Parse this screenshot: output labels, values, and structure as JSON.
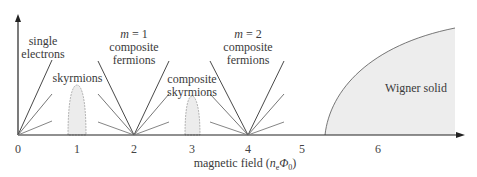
{
  "figure": {
    "x_axis": {
      "label_prefix": "magnetic field (",
      "label_var_n": "n",
      "label_sub_e": "e",
      "label_var_phi": "Φ",
      "label_sub_0": "0",
      "label_suffix": ")",
      "ticks": [
        "0",
        "1",
        "2",
        "3",
        "4",
        "5",
        "6"
      ]
    },
    "regions": {
      "single_electrons": {
        "line1": "single",
        "line2": "electrons"
      },
      "skyrmions": {
        "line1": "skyrmions"
      },
      "m1_cf": {
        "line1_var": "m",
        "line1_rest": " = 1",
        "line2": "composite",
        "line3": "fermions"
      },
      "composite_skyrmions": {
        "line1": "composite",
        "line2": "skyrmions"
      },
      "m2_cf": {
        "line1_var": "m",
        "line1_rest": " = 2",
        "line2": "composite",
        "line3": "fermions"
      },
      "wigner_solid": {
        "line1": "Wigner solid"
      }
    },
    "colors": {
      "line": "#3a3a3a",
      "fill": "#ececec"
    }
  }
}
